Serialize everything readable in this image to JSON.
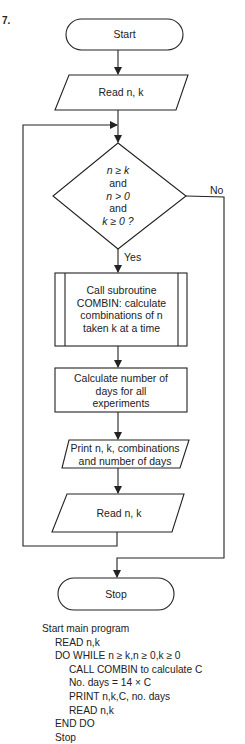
{
  "problem_number": "7.",
  "flowchart": {
    "start": "Start",
    "read1": "Read n, k",
    "decision": [
      "n ≥ k",
      "and",
      "n > 0",
      "and",
      "k ≥ 0 ?"
    ],
    "yes_label": "Yes",
    "no_label": "No",
    "subroutine": [
      "Call subroutine",
      "COMBIN: calculate",
      "combinations of n",
      "taken k at a time"
    ],
    "process": [
      "Calculate number of",
      "days for all",
      "experiments"
    ],
    "print": [
      "Print n, k, combinations",
      "and number of days"
    ],
    "read2": "Read n, k",
    "stop": "Stop"
  },
  "pseudocode": [
    {
      "indent": 0,
      "text": "Start main program"
    },
    {
      "indent": 1,
      "text": "READ n,k"
    },
    {
      "indent": 1,
      "text": "DO WHILE n ≥ k,n ≥ 0,k ≥ 0"
    },
    {
      "indent": 2,
      "text": "CALL COMBIN to calculate C"
    },
    {
      "indent": 2,
      "text": "No. days = 14 × C"
    },
    {
      "indent": 2,
      "text": "PRINT n,k,C, no. days"
    },
    {
      "indent": 2,
      "text": "READ n,k"
    },
    {
      "indent": 1,
      "text": "END DO"
    },
    {
      "indent": 1,
      "text": "Stop"
    }
  ],
  "colors": {
    "ink": "#222222",
    "background": "#ffffff"
  }
}
